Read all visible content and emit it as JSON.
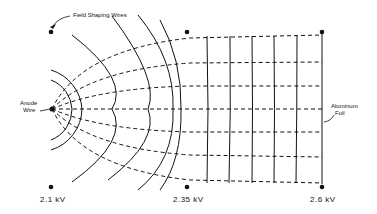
{
  "diagram": {
    "type": "electric field map between anode wire and aluminum foil",
    "labels": {
      "field_shaping_wires": "Field Shaping Wires",
      "anode_line1": "Anode",
      "anode_line2": "Wire",
      "foil_line1": "Aluminum",
      "foil_line2": "Foil"
    },
    "voltages": [
      "2.1 kV",
      "2.35 kV",
      "2.6 kV"
    ],
    "legend": {
      "solid_lines": "equipotential lines",
      "dashed_lines": "field lines"
    },
    "colors": {
      "ink": "#111111",
      "background": "#ffffff"
    }
  }
}
